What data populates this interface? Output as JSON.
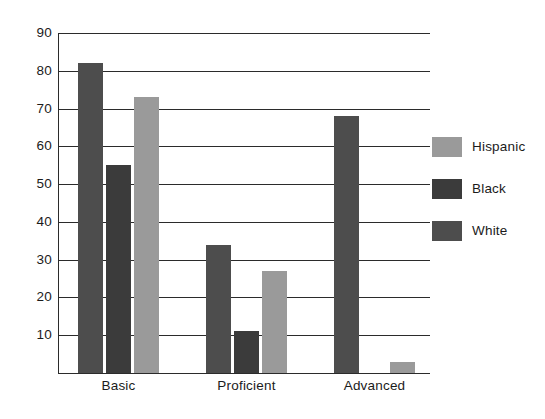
{
  "chart_data": {
    "type": "bar",
    "title": "",
    "subtitle": "",
    "xlabel": "",
    "ylabel": "",
    "categories": [
      "Basic",
      "Proficient",
      "Advanced"
    ],
    "series": [
      {
        "name": "White",
        "color": "#4d4d4d",
        "values": [
          82,
          34,
          68
        ]
      },
      {
        "name": "Black",
        "color": "#3b3b3b",
        "values": [
          55,
          11,
          0
        ]
      },
      {
        "name": "Hispanic",
        "color": "#9a9a9a",
        "values": [
          73,
          27,
          3
        ]
      }
    ],
    "legend": {
      "position": "right",
      "entries": [
        {
          "label": "Hispanic",
          "color": "#9a9a9a"
        },
        {
          "label": "Black",
          "color": "#3b3b3b"
        },
        {
          "label": "White",
          "color": "#4d4d4d"
        }
      ]
    },
    "ylim": [
      0,
      90
    ],
    "ytick_values": [
      10,
      20,
      30,
      40,
      50,
      60,
      70,
      80,
      90
    ],
    "ytick_labels": [
      "10",
      "20",
      "30",
      "40",
      "50",
      "60",
      "70",
      "80",
      "90"
    ],
    "grid": {
      "horizontal": true,
      "vertical": false,
      "color": "#2b2b2b"
    },
    "axis": {
      "left_spine": true,
      "bottom_spine": true,
      "top_spine": true,
      "right_spine": false
    },
    "background": "#ffffff"
  }
}
